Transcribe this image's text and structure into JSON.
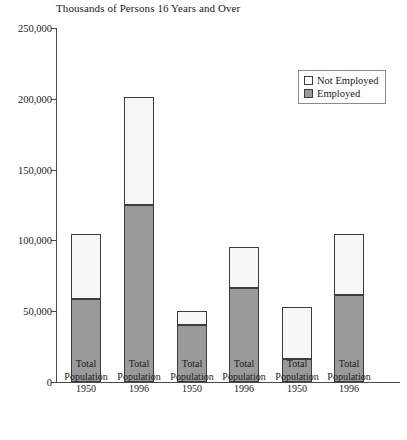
{
  "chart_data": {
    "type": "bar",
    "title": "Thousands of Persons 16 Years and Over",
    "subtitle": "",
    "xlabel": "",
    "ylabel": "",
    "stacked": true,
    "grid": false,
    "ylim": [
      0,
      250000
    ],
    "yticks": [
      0,
      50000,
      100000,
      150000,
      200000,
      250000
    ],
    "ytick_labels": [
      "0",
      "50,000",
      "100,000",
      "150,000",
      "200,000",
      "250,000"
    ],
    "categories": [
      "Total Population 1950",
      "Total Population 1996",
      "Total Population 1950",
      "Total Population 1996",
      "Total Population 1950",
      "Total Population 1996"
    ],
    "category_lines": [
      [
        "Total",
        "Population",
        "1950"
      ],
      [
        "Total",
        "Population",
        "1996"
      ],
      [
        "Total",
        "Population",
        "1950"
      ],
      [
        "Total",
        "Population",
        "1996"
      ],
      [
        "Total",
        "Population",
        "1950"
      ],
      [
        "Total",
        "Population",
        "1996"
      ]
    ],
    "legend": {
      "position": "top-right",
      "entries": [
        {
          "label": "Not Employed",
          "color": "#f7f7f5"
        },
        {
          "label": "Employed",
          "color": "#9a9a9a"
        }
      ]
    },
    "series": [
      {
        "name": "Employed",
        "color": "#9a9a9a",
        "values": [
          58600,
          125000,
          40300,
          66400,
          16000,
          61500
        ]
      },
      {
        "name": "Not Employed",
        "color": "#f7f7f5",
        "values": [
          46000,
          76000,
          9800,
          28900,
          37000,
          43000
        ]
      }
    ],
    "totals": [
      104600,
      201000,
      50100,
      95300,
      53000,
      104500
    ]
  }
}
